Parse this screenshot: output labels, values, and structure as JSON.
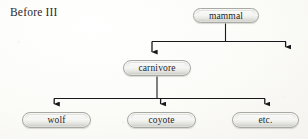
{
  "caption": {
    "text": "Before III"
  },
  "colors": {
    "background": "#fdfdfb",
    "node_border": "#a9a9a4",
    "node_fill_light": "#f6f6f4",
    "node_fill_dark": "#c9c9c4",
    "edge": "#19191b",
    "text": "#1c1c1e"
  },
  "diagram": {
    "type": "tree",
    "title": "Before III",
    "nodes": [
      {
        "id": "mammal",
        "label": "mammal",
        "level": 0,
        "x": 226,
        "y": 15
      },
      {
        "id": "carnivore",
        "label": "carnivore",
        "level": 1,
        "x": 157,
        "y": 68
      },
      {
        "id": "wolf",
        "label": "wolf",
        "level": 2,
        "x": 56,
        "y": 120
      },
      {
        "id": "coyote",
        "label": "coyote",
        "level": 2,
        "x": 161,
        "y": 120
      },
      {
        "id": "etc",
        "label": "etc.",
        "level": 2,
        "x": 265,
        "y": 120
      }
    ],
    "edges": [
      {
        "from": "mammal",
        "to": "carnivore",
        "arrow": "down"
      },
      {
        "from": "mammal",
        "to": "unlabeled-right",
        "arrow": "down"
      },
      {
        "from": "carnivore",
        "to": "wolf",
        "arrow": "down"
      },
      {
        "from": "carnivore",
        "to": "coyote",
        "arrow": "down"
      },
      {
        "from": "carnivore",
        "to": "etc",
        "arrow": "down"
      }
    ]
  }
}
